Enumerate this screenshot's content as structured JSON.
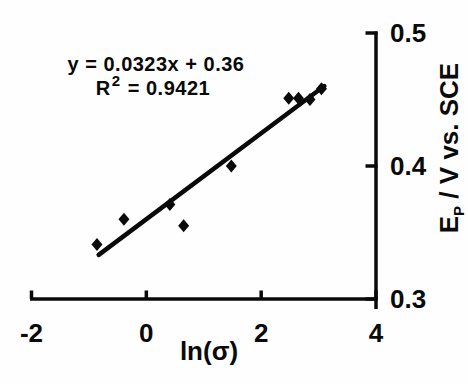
{
  "figure": {
    "background": "#fefefe",
    "ink": "#0a0a0a"
  },
  "annotation": {
    "equation": "y = 0.0323x + 0.36",
    "r_label": "R",
    "r_exponent": "2",
    "r_value": " = 0.9421"
  },
  "chart_data": {
    "type": "scatter",
    "title": "",
    "xlabel": "ln(σ)",
    "ylabel_base": "E",
    "ylabel_sub": "P",
    "ylabel_rest": " / V vs. SCE",
    "ylabel_full": "E_P / V vs. SCE",
    "xlim": [
      -2,
      4
    ],
    "ylim": [
      0.3,
      0.5
    ],
    "x_tick_values": [
      -2,
      0,
      2,
      4
    ],
    "x_tick_labels": [
      "-2",
      "0",
      "2",
      "4"
    ],
    "y_tick_values": [
      0.5,
      0.4,
      0.3
    ],
    "y_tick_labels": [
      "0.5",
      "0.4",
      "0.3"
    ],
    "grid": false,
    "legend_position": "none",
    "marker": "diamond",
    "marker_color": "#0a0a0a",
    "points": [
      {
        "x": -0.86,
        "y": 0.341
      },
      {
        "x": -0.39,
        "y": 0.36
      },
      {
        "x": 0.41,
        "y": 0.371
      },
      {
        "x": 0.65,
        "y": 0.355
      },
      {
        "x": 1.48,
        "y": 0.4
      },
      {
        "x": 2.48,
        "y": 0.451
      },
      {
        "x": 2.65,
        "y": 0.451
      },
      {
        "x": 2.85,
        "y": 0.45
      },
      {
        "x": 3.05,
        "y": 0.458
      }
    ],
    "fit": {
      "slope": 0.0323,
      "intercept": 0.36,
      "r_squared": 0.9421,
      "x_start": -0.83,
      "x_end": 3.1,
      "line_color": "#0a0a0a"
    }
  }
}
